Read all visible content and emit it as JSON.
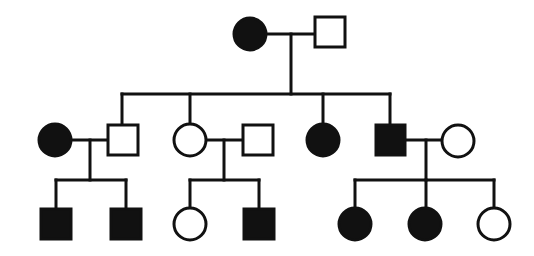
{
  "diagram": {
    "type": "pedigree",
    "colors": {
      "stroke": "#111111",
      "affected": "#111111",
      "unaffected": "#ffffff",
      "background": "#ffffff"
    },
    "legend_semantics": {
      "circle": "female",
      "square": "male",
      "filled": "affected",
      "open": "unaffected"
    },
    "generations": [
      {
        "label": "I",
        "individuals": [
          {
            "id": "I-1",
            "sex": "female",
            "affected": true
          },
          {
            "id": "I-2",
            "sex": "male",
            "affected": false
          }
        ]
      },
      {
        "label": "II",
        "individuals": [
          {
            "id": "II-spouse-1",
            "sex": "female",
            "affected": true,
            "married_in": true
          },
          {
            "id": "II-1",
            "sex": "male",
            "affected": false
          },
          {
            "id": "II-2",
            "sex": "female",
            "affected": false
          },
          {
            "id": "II-spouse-2",
            "sex": "male",
            "affected": false,
            "married_in": true
          },
          {
            "id": "II-3",
            "sex": "female",
            "affected": true
          },
          {
            "id": "II-4",
            "sex": "male",
            "affected": true
          },
          {
            "id": "II-spouse-3",
            "sex": "female",
            "affected": false,
            "married_in": true
          }
        ]
      },
      {
        "label": "III",
        "individuals": [
          {
            "id": "III-1",
            "sex": "male",
            "affected": true
          },
          {
            "id": "III-2",
            "sex": "male",
            "affected": true
          },
          {
            "id": "III-3",
            "sex": "female",
            "affected": false
          },
          {
            "id": "III-4",
            "sex": "male",
            "affected": true
          },
          {
            "id": "III-5",
            "sex": "female",
            "affected": true
          },
          {
            "id": "III-6",
            "sex": "female",
            "affected": true
          },
          {
            "id": "III-7",
            "sex": "female",
            "affected": false
          }
        ]
      }
    ],
    "matings": [
      {
        "partners": [
          "I-1",
          "I-2"
        ],
        "children": [
          "II-1",
          "II-2",
          "II-3",
          "II-4"
        ]
      },
      {
        "partners": [
          "II-spouse-1",
          "II-1"
        ],
        "children": [
          "III-1",
          "III-2"
        ]
      },
      {
        "partners": [
          "II-2",
          "II-spouse-2"
        ],
        "children": [
          "III-3",
          "III-4"
        ]
      },
      {
        "partners": [
          "II-4",
          "II-spouse-3"
        ],
        "children": [
          "III-5",
          "III-6",
          "III-7"
        ]
      }
    ]
  }
}
